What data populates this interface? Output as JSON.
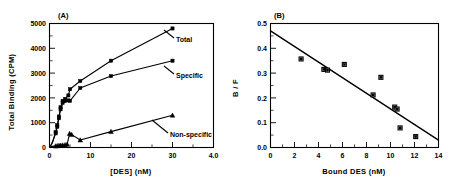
{
  "figure": {
    "panel_a_label": "(A)",
    "panel_b_label": "(B)"
  },
  "chart_data": [
    {
      "type": "line",
      "panel": "(A)",
      "title": "",
      "xlabel": "[DES]   (nM)",
      "ylabel": "Total   Binding   (CPM)",
      "xlim": [
        0,
        40
      ],
      "ylim": [
        0,
        5000
      ],
      "xticks": [
        0,
        10,
        20,
        30,
        40
      ],
      "xtick_labels": [
        "0",
        "10",
        "20",
        "30",
        "4.0"
      ],
      "yticks": [
        0,
        1000,
        2000,
        3000,
        4000,
        5000
      ],
      "ytick_labels": [
        "0",
        "1000",
        "2000",
        "3000",
        "4000",
        "5000"
      ],
      "grid": false,
      "legend": "inline-labels",
      "series": [
        {
          "name": "Total",
          "label": "Total",
          "marker": "filled-square",
          "x": [
            0.2,
            0.5,
            0.8,
            1.1,
            1.5,
            1.9,
            2.3,
            2.7,
            3.2,
            3.8,
            4.6,
            5.0,
            7.5,
            15.0,
            30.0
          ],
          "y": [
            60,
            140,
            260,
            420,
            620,
            900,
            1250,
            1620,
            1880,
            1960,
            2100,
            2350,
            2680,
            3500,
            4800
          ]
        },
        {
          "name": "Specific",
          "label": "Specific",
          "marker": "filled-square",
          "x": [
            0.2,
            0.5,
            0.8,
            1.1,
            1.5,
            1.9,
            2.3,
            2.7,
            3.2,
            3.8,
            4.6,
            5.0,
            7.5,
            15.0,
            30.0
          ],
          "y": [
            50,
            120,
            230,
            380,
            570,
            840,
            1180,
            1540,
            1800,
            1870,
            1900,
            1880,
            2400,
            2880,
            3500
          ]
        },
        {
          "name": "Non-specific",
          "label": "Non-specific",
          "marker": "filled-triangle",
          "x": [
            0.2,
            0.5,
            0.8,
            1.1,
            1.5,
            1.9,
            2.3,
            2.7,
            3.2,
            3.8,
            4.3,
            4.9,
            5.4,
            7.5,
            15.0,
            30.0
          ],
          "y": [
            20,
            35,
            45,
            55,
            60,
            70,
            80,
            90,
            100,
            110,
            130,
            560,
            520,
            300,
            640,
            1300
          ]
        }
      ]
    },
    {
      "type": "scatter",
      "panel": "(B)",
      "title": "",
      "xlabel": "Bound   DES   (nM)",
      "ylabel": "B / F",
      "xlim": [
        0,
        14
      ],
      "ylim": [
        0.0,
        0.5
      ],
      "xticks": [
        0,
        2,
        4,
        6,
        8,
        10,
        12,
        14
      ],
      "xtick_labels": [
        "0",
        "2",
        "4",
        "6",
        "8",
        "10",
        "12",
        "14"
      ],
      "yticks": [
        0.0,
        0.1,
        0.2,
        0.3,
        0.4,
        0.5
      ],
      "ytick_labels": [
        "0.0",
        "0.1",
        "0.2",
        "0.3",
        "0.4",
        "0.5"
      ],
      "grid": false,
      "marker": "square",
      "points": [
        {
          "x": 2.55,
          "y": 0.357
        },
        {
          "x": 4.45,
          "y": 0.315
        },
        {
          "x": 4.75,
          "y": 0.312
        },
        {
          "x": 6.15,
          "y": 0.335
        },
        {
          "x": 8.55,
          "y": 0.212
        },
        {
          "x": 9.2,
          "y": 0.283
        },
        {
          "x": 10.35,
          "y": 0.163
        },
        {
          "x": 10.55,
          "y": 0.155
        },
        {
          "x": 10.8,
          "y": 0.079
        },
        {
          "x": 12.1,
          "y": 0.044
        }
      ],
      "fit_line": {
        "x": [
          0,
          14
        ],
        "y": [
          0.47,
          0.03
        ]
      }
    }
  ]
}
